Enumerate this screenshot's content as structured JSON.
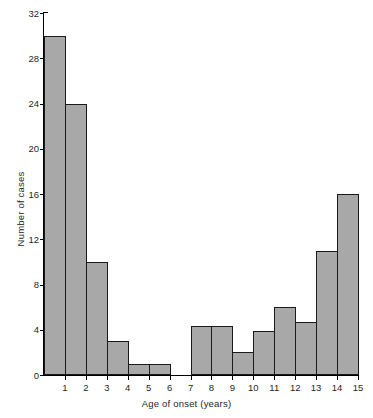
{
  "chart_data": {
    "type": "bar",
    "title": "",
    "subtitle": "",
    "xlabel": "Age of onset (years)",
    "ylabel": "Number of cases",
    "grid": false,
    "legend": null,
    "bin_edges": [
      0,
      1,
      2,
      3,
      4,
      5,
      6,
      7,
      8,
      9,
      10,
      11,
      12,
      13,
      14,
      15
    ],
    "categories": [
      "0-1",
      "1-2",
      "2-3",
      "3-4",
      "4-5",
      "5-6",
      "6-7",
      "7-8",
      "8-9",
      "9-10",
      "10-11",
      "11-12",
      "12-13",
      "13-14",
      "14-15"
    ],
    "values": [
      30,
      24,
      10,
      3,
      1,
      1,
      0,
      4.3,
      4.3,
      2,
      3.9,
      6,
      4.7,
      11,
      16
    ],
    "xlim": [
      0,
      15
    ],
    "ylim": [
      0,
      32
    ],
    "xticks": [
      1,
      2,
      3,
      4,
      5,
      6,
      7,
      8,
      9,
      10,
      11,
      12,
      13,
      14,
      15
    ],
    "xtick_labels": [
      "1",
      "2",
      "3",
      "4",
      "5",
      "6",
      "7",
      "8",
      "9",
      "10",
      "11",
      "12",
      "13",
      "14",
      "15"
    ],
    "yticks": [
      0,
      4,
      8,
      12,
      16,
      20,
      24,
      28,
      32
    ],
    "ytick_labels": [
      "0",
      "4",
      "8",
      "12",
      "16",
      "20",
      "24",
      "28",
      "32"
    ],
    "bar_fill_color": "#a8a8a8",
    "bar_edge_color": "#1a1a1a",
    "axis_color": "#000000",
    "background_color": "#ffffff"
  }
}
